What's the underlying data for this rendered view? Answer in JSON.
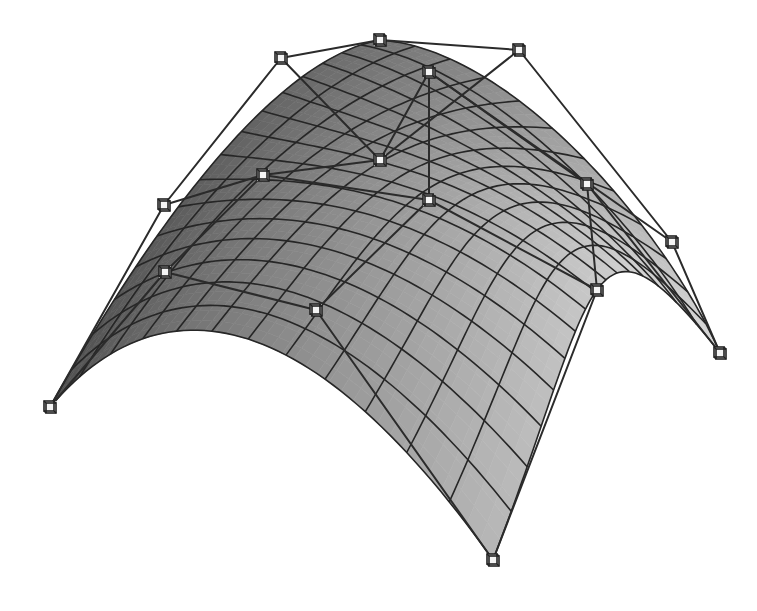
{
  "figure": {
    "background": "#ffffff",
    "surface": {
      "shade_dark": "#4a4a4a",
      "shade_mid": "#9a9a9a",
      "shade_light": "#d9d9d9",
      "grid_color": "#262626",
      "grid_u": 16,
      "grid_v": 12
    },
    "control_net_color": "#2b2b2b",
    "control_points": [
      [
        [
          50,
          407
        ],
        [
          165,
          272
        ],
        [
          316,
          310
        ],
        [
          493,
          560
        ]
      ],
      [
        [
          164,
          205
        ],
        [
          263,
          175
        ],
        [
          429,
          200
        ],
        [
          597,
          290
        ]
      ],
      [
        [
          281,
          58
        ],
        [
          380,
          160
        ],
        [
          429,
          72
        ],
        [
          587,
          184
        ]
      ],
      [
        [
          380,
          40
        ],
        [
          519,
          50
        ],
        [
          672,
          242
        ],
        [
          720,
          353
        ]
      ]
    ]
  }
}
